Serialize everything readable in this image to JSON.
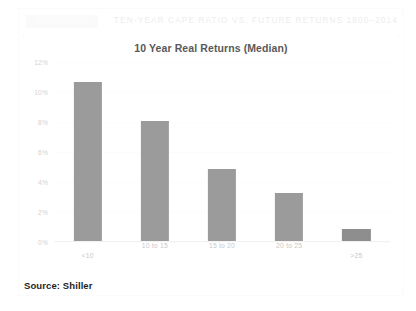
{
  "masthead": {
    "logo_text": "BUSINESS",
    "title": "TEN-YEAR CAPE RATIO VS. FUTURE RETURNS 1900–2014"
  },
  "footer": {
    "source": "Source: Shiller"
  },
  "colors": {
    "bar": "#9b9b9b",
    "bar_last": "#8e8e8e",
    "title_text": "#595959",
    "tick_text": "#cccccc",
    "gridline": "#fcfcfc",
    "source_text": "#1f1f1f",
    "masthead_text": "#ededed"
  },
  "chart_data": {
    "type": "bar",
    "title": "10 Year Real Returns (Median)",
    "xlabel": "",
    "ylabel": "",
    "categories": [
      "<10",
      "10 to 15",
      "15 to 20",
      "20 to 25",
      ">25"
    ],
    "values": [
      10.7,
      8.1,
      4.9,
      3.3,
      0.9
    ],
    "ylim": [
      0,
      12
    ],
    "yticks": [
      0,
      2,
      4,
      6,
      8,
      10,
      12
    ],
    "ytick_labels": [
      "0%",
      "2%",
      "4%",
      "6%",
      "8%",
      "10%",
      "12%"
    ],
    "grid": true,
    "legend": false
  }
}
